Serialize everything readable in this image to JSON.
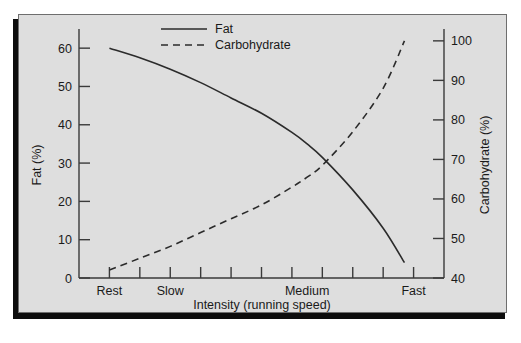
{
  "chart_data": {
    "type": "line",
    "title": "",
    "xlabel": "Intensity (running speed)",
    "ylabel": "Fat (%)",
    "y2label": "Carbohydrate (%)",
    "grid": false,
    "legend_position": "top-center",
    "xlim": [
      0,
      12
    ],
    "ylim": [
      0,
      65
    ],
    "y2lim": [
      40,
      103
    ],
    "x_tick_count": 12,
    "x_category_labels": [
      "Rest",
      "Slow",
      "Medium",
      "Fast"
    ],
    "x_category_positions": [
      1,
      3,
      7.5,
      11
    ],
    "y_tick_labels": [
      "0",
      "10",
      "20",
      "30",
      "40",
      "50",
      "60"
    ],
    "y_tick_values": [
      0,
      10,
      20,
      30,
      40,
      50,
      60
    ],
    "y2_tick_labels": [
      "40",
      "50",
      "60",
      "70",
      "80",
      "90",
      "100"
    ],
    "y2_tick_values": [
      40,
      50,
      60,
      70,
      80,
      90,
      100
    ],
    "series": [
      {
        "name": "Fat",
        "axis": "left",
        "style": "solid",
        "color": "#2b2b2b",
        "x": [
          1,
          2,
          3,
          4,
          5,
          6,
          7,
          7.5,
          8,
          9,
          10,
          10.7
        ],
        "values": [
          60,
          57.5,
          54.5,
          51,
          47,
          43,
          38,
          35,
          31.5,
          23,
          13,
          4
        ]
      },
      {
        "name": "Carbohydrate",
        "axis": "right",
        "style": "dashed",
        "color": "#2b2b2b",
        "x": [
          1,
          2,
          3,
          4,
          5,
          6,
          7,
          7.5,
          8,
          9,
          10,
          10.7
        ],
        "values": [
          42,
          45,
          48,
          51.5,
          55,
          58.5,
          63,
          65.5,
          68.5,
          77,
          88,
          100
        ]
      }
    ],
    "legend": [
      {
        "label": "Fat",
        "style": "solid"
      },
      {
        "label": "Carbohydrate",
        "style": "dashed"
      }
    ]
  },
  "colors": {
    "page_background": "#ffffff",
    "figure_background": "#dedede",
    "frame_border": "#6e6e6e",
    "shadow": "#0d0d0d",
    "ink": "#1a1a1a",
    "line": "#2b2b2b"
  }
}
